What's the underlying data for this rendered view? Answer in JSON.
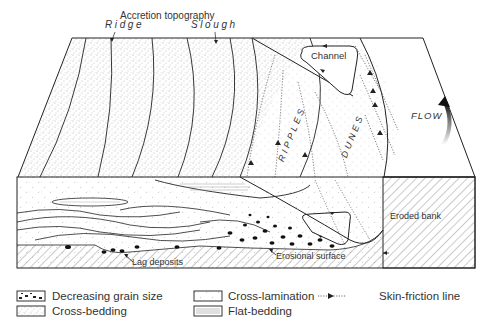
{
  "diagram": {
    "title_annotation": "Accretion topography",
    "top_labels": {
      "ridge": "Ridge",
      "slough": "Slough",
      "channel": "Channel",
      "ripples": "RIPPLES",
      "dunes": "DUNES",
      "flow": "FLOW"
    },
    "section_labels": {
      "eroded_bank": "Eroded bank",
      "lag_deposits": "Lag deposits",
      "erosional_surface": "Erosional surface"
    },
    "colors": {
      "line": "#222222",
      "stipple": "#555555",
      "background": "#ffffff"
    }
  },
  "legend": {
    "items": [
      {
        "key": "decreasing-grain-size",
        "label": "Decreasing grain size"
      },
      {
        "key": "cross-bedding",
        "label": "Cross-bedding"
      },
      {
        "key": "cross-lamination",
        "label": "Cross-lamination"
      },
      {
        "key": "flat-bedding",
        "label": "Flat-bedding"
      },
      {
        "key": "skin-friction-line",
        "label": "Skin-friction line"
      }
    ]
  }
}
